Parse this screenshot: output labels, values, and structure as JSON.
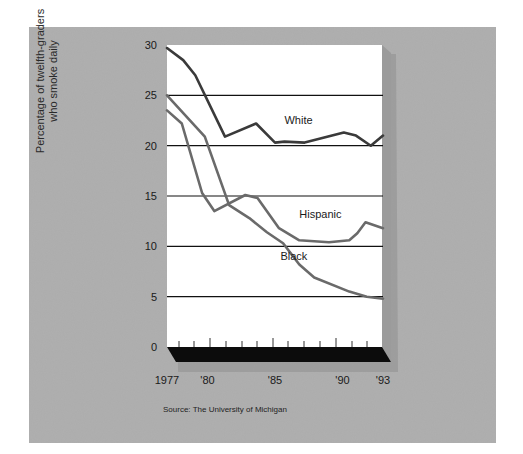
{
  "chart_data": {
    "type": "line",
    "title": "",
    "xlabel": "",
    "ylabel": "Percentage of twelfth-graders who smoke daily",
    "ylabel_lines": [
      "Percentage of twelfth-graders",
      "who smoke daily"
    ],
    "ylim": [
      0,
      30
    ],
    "xlim": [
      1977,
      1993
    ],
    "y_ticks": [
      0,
      5,
      10,
      15,
      20,
      25,
      30
    ],
    "x_tick_labels": [
      {
        "year": 1977,
        "label": "1977"
      },
      {
        "year": 1980,
        "label": "'80"
      },
      {
        "year": 1985,
        "label": "'85"
      },
      {
        "year": 1990,
        "label": "'90"
      },
      {
        "year": 1993,
        "label": "'93"
      }
    ],
    "grid": "horizontal",
    "legend": "inline labels",
    "series": [
      {
        "name": "White",
        "color": "#3a3a3a",
        "x": [
          1977,
          1978.2,
          1979.1,
          1981.3,
          1983.6,
          1985,
          1985.7,
          1987.2,
          1990.1,
          1991,
          1992.1,
          1993
        ],
        "values": [
          29.7,
          28.5,
          27,
          20.9,
          22.2,
          20.3,
          20.4,
          20.3,
          21.3,
          21,
          20,
          21
        ],
        "label_pos": {
          "x": 1985.7,
          "y": 22.2
        }
      },
      {
        "name": "Hispanic",
        "color": "#6a6a6a",
        "x": [
          1977,
          1978.1,
          1979.6,
          1980.5,
          1982.8,
          1983.7,
          1985.3,
          1986.8,
          1989,
          1990.5,
          1991.1,
          1991.7,
          1993
        ],
        "values": [
          23.5,
          22.2,
          15.3,
          13.5,
          15.1,
          14.8,
          11.8,
          10.6,
          10.4,
          10.6,
          11.3,
          12.4,
          11.8
        ],
        "label_pos": {
          "x": 1986.8,
          "y": 12.8
        }
      },
      {
        "name": "Black",
        "color": "#6a6a6a",
        "x": [
          1977,
          1979.8,
          1981.6,
          1983.1,
          1984.4,
          1985.6,
          1986.8,
          1987.9,
          1990.5,
          1991.8,
          1993
        ],
        "values": [
          25,
          20.9,
          14.1,
          12.8,
          11.4,
          10.3,
          8.2,
          6.9,
          5.5,
          5,
          4.8
        ],
        "label_pos": {
          "x": 1985.4,
          "y": 8.6
        }
      }
    ]
  },
  "source": "Source: The University of Michigan"
}
